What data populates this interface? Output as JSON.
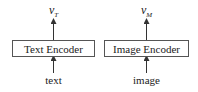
{
  "diagram": {
    "encoders": [
      {
        "label": "Text Encoder",
        "input": "text",
        "output_base": "v",
        "output_sub": "T"
      },
      {
        "label": "Image Encoder",
        "input": "image",
        "output_base": "v",
        "output_sub": "M"
      }
    ],
    "colors": {
      "stroke": "#555555",
      "text": "#222222",
      "background": "#ffffff"
    }
  }
}
